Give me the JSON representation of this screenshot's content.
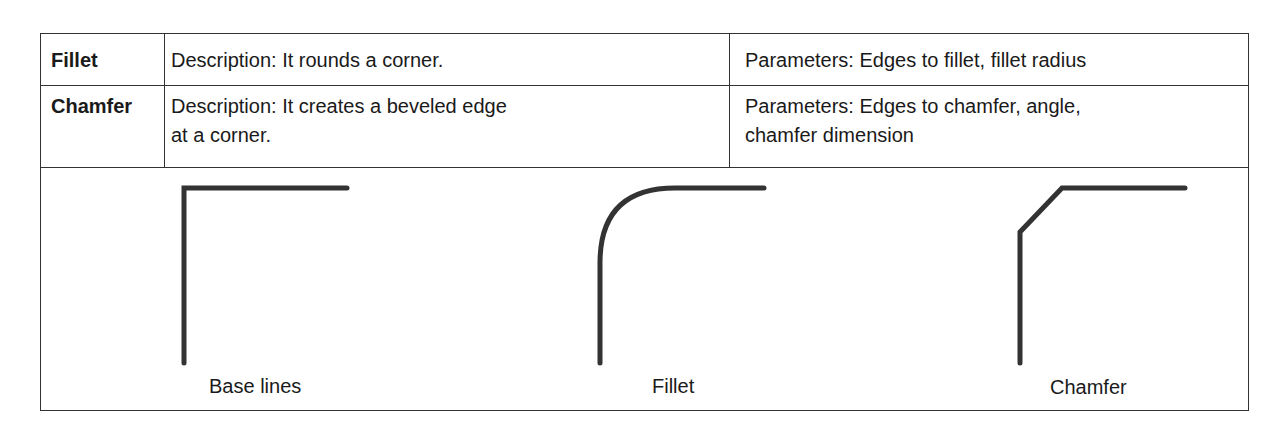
{
  "table": {
    "rows": [
      {
        "name": "Fillet",
        "description": [
          "Description: It rounds a corner."
        ],
        "parameters": [
          "Parameters: Edges to fillet, fillet radius"
        ]
      },
      {
        "name": "Chamfer",
        "description": [
          "Description: It creates a beveled edge",
          "at a corner."
        ],
        "parameters": [
          "Parameters: Edges to chamfer, angle,",
          "chamfer dimension"
        ]
      }
    ]
  },
  "figures": {
    "line_color": "#333333",
    "captions": {
      "base": "Base lines",
      "fillet": "Fillet",
      "chamfer": "Chamfer"
    }
  }
}
